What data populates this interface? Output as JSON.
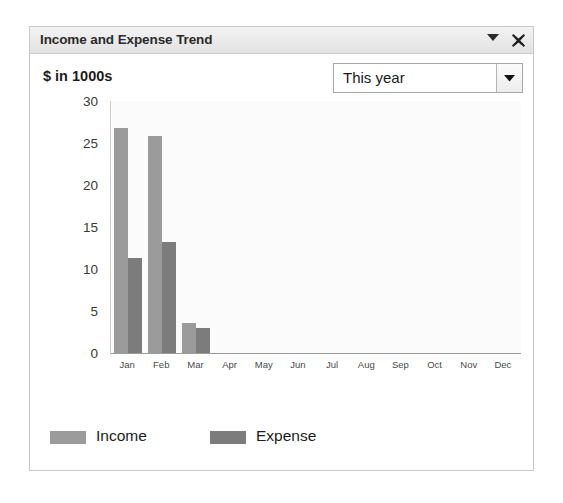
{
  "widget": {
    "title": "Income and Expense Trend",
    "collapse_icon": "chevron-down-icon",
    "close_icon": "close-icon",
    "units_label": "$ in 1000s",
    "period": {
      "selected": "This year",
      "arrow_icon": "triangle-down-icon"
    }
  },
  "chart_data": {
    "type": "bar",
    "title": "Income and Expense Trend",
    "subtitle": "$ in 1000s",
    "xlabel": "",
    "ylabel": "",
    "ylim": [
      0,
      30
    ],
    "yticks": [
      0,
      5,
      10,
      15,
      20,
      25,
      30
    ],
    "ytick_labels": [
      "0",
      "5",
      "10",
      "15",
      "20",
      "25",
      "30"
    ],
    "grid": false,
    "legend_position": "bottom-left",
    "categories": [
      "Jan",
      "Feb",
      "Mar",
      "Apr",
      "May",
      "Jun",
      "Jul",
      "Aug",
      "Sep",
      "Oct",
      "Nov",
      "Dec"
    ],
    "series": [
      {
        "name": "Income",
        "color": "#9b9b9b",
        "values": [
          26.8,
          25.8,
          3.6,
          0,
          0,
          0,
          0,
          0,
          0,
          0,
          0,
          0
        ]
      },
      {
        "name": "Expense",
        "color": "#7c7c7c",
        "values": [
          11.3,
          13.2,
          3.0,
          0,
          0,
          0,
          0,
          0,
          0,
          0,
          0,
          0
        ]
      }
    ]
  }
}
